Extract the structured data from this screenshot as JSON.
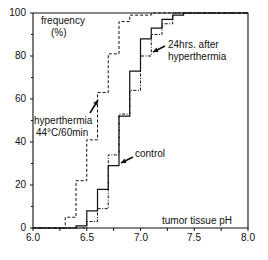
{
  "chart_data": {
    "type": "line",
    "subtype": "cumulative-step",
    "title": "",
    "ylabel": "frequency (%)",
    "ylabel_lines": [
      "frequency",
      "(%)"
    ],
    "xlabel": "tumor tissue pH",
    "xlim": [
      6.0,
      8.0
    ],
    "ylim": [
      0,
      100
    ],
    "x_ticks": [
      "6.0",
      "6.5",
      "7.0",
      "7.5",
      "8.0"
    ],
    "y_ticks": [
      "0",
      "20",
      "40",
      "60",
      "80",
      "100"
    ],
    "grid": false,
    "series": [
      {
        "name": "hyperthermia 44°C/60min",
        "style": "dashed",
        "steps": [
          [
            6.3,
            5
          ],
          [
            6.4,
            22
          ],
          [
            6.5,
            41
          ],
          [
            6.6,
            63
          ],
          [
            6.7,
            81
          ],
          [
            6.8,
            96
          ],
          [
            6.9,
            99
          ],
          [
            7.1,
            100
          ]
        ]
      },
      {
        "name": "control",
        "style": "solid",
        "steps": [
          [
            6.4,
            1
          ],
          [
            6.5,
            8
          ],
          [
            6.6,
            18
          ],
          [
            6.7,
            29
          ],
          [
            6.8,
            52
          ],
          [
            6.9,
            73
          ],
          [
            7.0,
            88
          ],
          [
            7.1,
            93
          ],
          [
            7.2,
            97
          ],
          [
            7.3,
            99
          ],
          [
            7.4,
            100
          ]
        ]
      },
      {
        "name": "24hrs. after hyperthermia",
        "style": "dash-dot",
        "steps": [
          [
            6.5,
            3
          ],
          [
            6.6,
            9
          ],
          [
            6.7,
            34
          ],
          [
            6.8,
            53
          ],
          [
            6.9,
            64
          ],
          [
            7.0,
            80
          ],
          [
            7.1,
            90
          ],
          [
            7.2,
            95
          ],
          [
            7.3,
            100
          ]
        ]
      }
    ],
    "annotations": [
      {
        "text": "hyperthermia",
        "line2": "44°C/60min",
        "points_to": "hyperthermia 44°C/60min"
      },
      {
        "text": "control",
        "points_to": "control"
      },
      {
        "text": "24hrs. after",
        "line2": "hyperthermia",
        "points_to": "24hrs. after hyperthermia"
      }
    ]
  },
  "labels": {
    "ylabel_1": "frequency",
    "ylabel_2": "(%)",
    "xlabel": "tumor tissue pH",
    "ann_hyper_1": "hyperthermia",
    "ann_hyper_2": "44°C/60min",
    "ann_control": "control",
    "ann_24_1": "24hrs. after",
    "ann_24_2": "hyperthermia"
  },
  "ticks": {
    "y": [
      "0",
      "20",
      "40",
      "60",
      "80",
      "100"
    ],
    "x": [
      "6.0",
      "6.5",
      "7.0",
      "7.5",
      "8.0"
    ]
  }
}
